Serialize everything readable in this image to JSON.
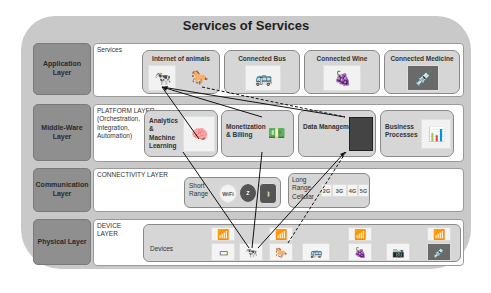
{
  "title": "Services of Services",
  "layers": [
    {
      "label": "Application Layer",
      "panel_title": "Services"
    },
    {
      "label": "Middle-Ware Layer",
      "panel_title": "PLATFORM LAYER (Orchestration, Integration, Automation)"
    },
    {
      "label": "Communication Layer",
      "panel_title": "CONNECTIVITY LAYER"
    },
    {
      "label": "Physical Layer",
      "panel_title": "DEVICE LAYER"
    }
  ],
  "services": [
    {
      "label": "Internet of animals",
      "icons": [
        "cow-icon",
        "horse-icon"
      ]
    },
    {
      "label": "Connected Bus",
      "icons": [
        "bus-icon"
      ]
    },
    {
      "label": "Connected Wine",
      "icons": [
        "grapes-icon"
      ]
    },
    {
      "label": "Connected Medicine",
      "icons": [
        "medicine-icon"
      ]
    }
  ],
  "platform": [
    {
      "label": "Analytics & Machine Learning",
      "icon": "brain-heads-icon"
    },
    {
      "label": "Monetization & Billing",
      "icon": "money-icon"
    },
    {
      "label": "Data Management",
      "icon": "server-doors-icon"
    },
    {
      "label": "Business Processes",
      "icon": "business-icon"
    }
  ],
  "connectivity": {
    "short_range": {
      "label": "Short Range",
      "techs": [
        "WiFi",
        "Zigbee",
        "Bluetooth"
      ]
    },
    "long_range": {
      "label": "Long Range Cellular",
      "techs": [
        "2G",
        "3G",
        "4G",
        "5G"
      ]
    }
  },
  "devices": {
    "label": "Devices",
    "items": [
      "router",
      "sensor-tag",
      "cow",
      "router",
      "horse",
      "bus",
      "router",
      "grapes",
      "camera",
      "router",
      "medicine"
    ]
  },
  "colors": {
    "outer_bg": "#c9c9c9",
    "layer_label_bg": "#8f8f8f",
    "card_bg": "#d6d6d6",
    "panel_bg": "#ffffff"
  }
}
